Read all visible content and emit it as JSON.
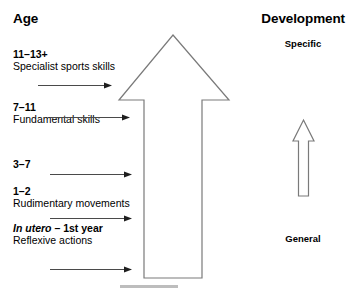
{
  "figure": {
    "width": 358,
    "height": 301,
    "background": "#ffffff",
    "stroke_color": "#6b6b6b",
    "text_color": "#000000"
  },
  "headings": {
    "left": "Age",
    "right": "Development"
  },
  "development_scale": {
    "top_label": "Specific",
    "bottom_label": "General",
    "arrow_direction": "up",
    "arrow_style": "outline"
  },
  "age_groups": [
    {
      "range": "11–13+",
      "range_italic_part": "",
      "description": "Specialist sports skills"
    },
    {
      "range": "7–11",
      "range_italic_part": "",
      "description": "Fundamental skills"
    },
    {
      "range": "3–7",
      "range_italic_part": "",
      "description": ""
    },
    {
      "range": "1–2",
      "range_italic_part": "",
      "description": "Rudimentary movements"
    },
    {
      "range": "– 1st year",
      "range_italic_part": "In utero",
      "description": "Reflexive actions"
    }
  ],
  "progress_arrows": [
    {
      "label": "progression-arrow-1"
    },
    {
      "label": "progression-arrow-2"
    },
    {
      "label": "progression-arrow-3"
    },
    {
      "label": "progression-arrow-4"
    },
    {
      "label": "progression-arrow-5"
    }
  ],
  "central_arrow": {
    "direction": "up",
    "style": "outline",
    "meaning": "developmental progression"
  },
  "caption": {
    "text": "",
    "visible": false
  }
}
